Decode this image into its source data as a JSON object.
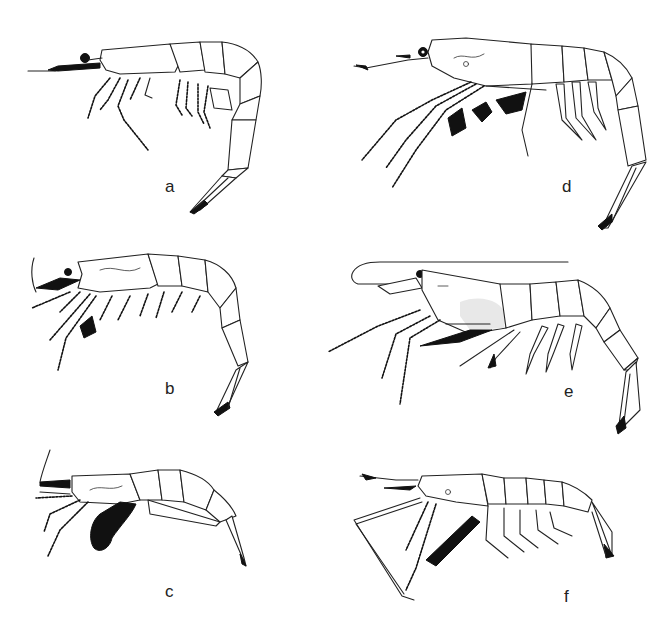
{
  "figure": {
    "background_color": "#ffffff",
    "line_color": "#222222",
    "panels": [
      {
        "id": "a",
        "label": "a",
        "subject": "shrimp-lateral-view",
        "body_posture": "strongly curved abdomen"
      },
      {
        "id": "b",
        "label": "b",
        "subject": "shrimp-lateral-view",
        "body_posture": "curved abdomen, setose legs"
      },
      {
        "id": "c",
        "label": "c",
        "subject": "shrimp-lateral-view",
        "body_posture": "compact body with dark egg mass"
      },
      {
        "id": "d",
        "label": "d",
        "subject": "shrimp-lateral-view",
        "body_posture": "long rostrum, plumose legs, curved tail"
      },
      {
        "id": "e",
        "label": "e",
        "subject": "shrimp-lateral-view",
        "body_posture": "long antenna over carapace, stippled carapace"
      },
      {
        "id": "f",
        "label": "f",
        "subject": "shrimp-lateral-view",
        "body_posture": "long thin pereiopod, straight body"
      }
    ]
  }
}
